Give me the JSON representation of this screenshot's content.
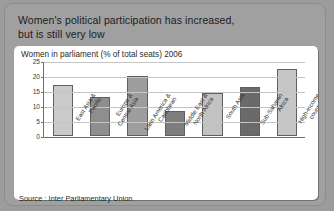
{
  "title": {
    "line1": "Women's political participation has increased,",
    "line2": "but is still very low"
  },
  "source": "Source : Inter Parliamentary Union",
  "colors": {
    "frame": "#a0a0a0",
    "panel": "#ffffff",
    "bar_light": "#cacaca",
    "bar_mid": "#8e8e8e",
    "bar_dark": "#6a6a6a",
    "axis": "#6f6f6f",
    "grid": "#c4c4c4"
  },
  "chart_data": {
    "type": "bar",
    "title": "Women in parliament (% of total seats) 2006",
    "xlabel": "",
    "ylabel": "",
    "ylim": [
      0,
      25
    ],
    "yticks": [
      0,
      5,
      10,
      15,
      20,
      25
    ],
    "grid": true,
    "legend": "none",
    "categories": [
      "East Asia & Pacific",
      "Europe & Central Asia",
      "Latin America & Caribbean",
      "Middle East & North Africa",
      "South Asia",
      "Sub-Saharan Africa",
      "High-income countries"
    ],
    "category_lines": [
      [
        "East Asia &",
        "Pacific"
      ],
      [
        "Europe &",
        "Central Asia"
      ],
      [
        "Latin America &",
        "Caribbean"
      ],
      [
        "Middle East &",
        "North Africa"
      ],
      [
        "South Asia"
      ],
      [
        "Sub-Saharan",
        "Africa"
      ],
      [
        "High-income",
        "countries"
      ]
    ],
    "values": [
      17.0,
      13.0,
      20.0,
      8.2,
      14.3,
      16.4,
      22.4
    ],
    "bar_colors": [
      "#cacaca",
      "#8e8e8e",
      "#9e9e9e",
      "#7e7e7e",
      "#c2c2c2",
      "#6a6a6a",
      "#c6c6c6"
    ]
  }
}
